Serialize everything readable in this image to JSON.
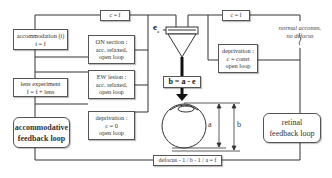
{
  "diagram": {
    "top_left_box": {
      "text": "c = f"
    },
    "top_right_box": {
      "text": "c = f"
    },
    "accommodation_box": {
      "line1": "accommodation (i)",
      "line2": "i = f"
    },
    "lens_experiment_box": {
      "line1": "lens experiment",
      "line2": "f = f + lens"
    },
    "on_section_box": {
      "line1": "ON section :",
      "line2": "acc. relaxed,",
      "line3": "open loop"
    },
    "ew_lesion_box": {
      "line1": "EW lesion :",
      "line2": "acc. relaxed,",
      "line3": "open loop"
    },
    "deprivation_zero_box": {
      "line1": "deprivation :",
      "line2": "c = 0",
      "line3": "open loop"
    },
    "deprivation_const_box": {
      "line1": "deprivation :",
      "line2": "c = const",
      "line3": "open loop"
    },
    "accommodative_loop": {
      "line1": "accommodative",
      "line2": "feedback loop"
    },
    "retinal_loop": {
      "line1": "retinal",
      "line2": "feedback loop"
    },
    "ea_label": {
      "main": "e",
      "sub": "a"
    },
    "b_formula_box": {
      "text": "b = a - e"
    },
    "defocus_box": {
      "text": "defocus - 1 / b - 1 / a = f"
    },
    "normal_note": {
      "line1": "normal accomm.",
      "line2": "no defocus"
    },
    "dimension_a": "a",
    "dimension_b": "b"
  },
  "colors": {
    "line": "#333333",
    "box_border": "#555555",
    "background": "#ffffff"
  }
}
